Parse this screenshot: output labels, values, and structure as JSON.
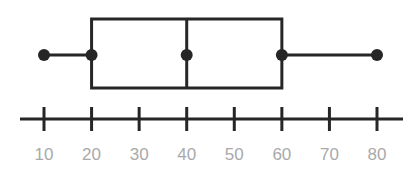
{
  "chart_data": {
    "type": "boxplot",
    "title": "",
    "xlabel": "",
    "ylabel": "",
    "orientation": "horizontal",
    "xlim": [
      10,
      80
    ],
    "tick_values": [
      10,
      20,
      30,
      40,
      50,
      60,
      70,
      80
    ],
    "tick_labels": [
      "10",
      "20",
      "30",
      "40",
      "50",
      "60",
      "70",
      "80"
    ],
    "grid": false,
    "box": {
      "min": 10,
      "q1": 20,
      "median": 40,
      "q3": 60,
      "max": 80
    },
    "colors": {
      "line": "#262626",
      "tick_label": "#a9a9a9"
    }
  }
}
